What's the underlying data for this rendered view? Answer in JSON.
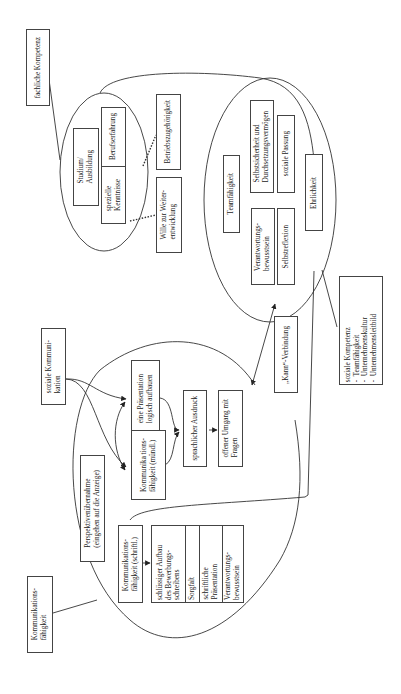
{
  "diagram": {
    "orientation": "rotated 90° counter-clockwise",
    "fachliche": {
      "title": "fachliche Kompetenz",
      "ellipse_items": {
        "studium": "Studium/\nAusbildung",
        "berufserfahrung": "Berufserfahrung",
        "spezielle_kenntnisse": "spezielle\nKenntnisse"
      },
      "outside_items": {
        "betriebszugehoerigkeit": "Betriebszugehörigkeit",
        "wille": "Wille zur Weiter-\nentwicklung"
      }
    },
    "soziale": {
      "ellipse_items": {
        "teamfaehigkeit": "Teamfähigkeit",
        "selbstsicherheit": "Selbstsicherheit und\nDurchsetzungsvermögen",
        "soziale_passung": "soziale Passung",
        "ehrlichkeit": "Ehrlichkeit",
        "verantwortung": "Verantwortungs-\nbewusstsein",
        "selbstreflexion": "Selbstreflexion"
      },
      "legend": {
        "title": "soziale Kompetenz",
        "items": [
          "Teamfähigkeit",
          "Unternehmenskultur",
          "Unternehmensleitbild"
        ],
        "bullet": "-"
      }
    },
    "kann_verbindung": "„Kann“-Verbindung",
    "kommunikation": {
      "title": "Kommunikations-\nfähigkeit",
      "soziale_kommunikation": "soziale Kommuni-\nkation",
      "perspektive": "Perspektivenübernahme\n(eingehen auf die Anzeige)",
      "muendlich": "Kommunika tions-\nfähigkeit (mündl.)",
      "praesentation": "eine Präsentation\nlogisch aufbauen",
      "sprachlicher_ausdruck": "sprachlicher Ausdruck",
      "offener_umgang": "offener Umgang mit\nFragen",
      "schriftlich": "Kommunikations-\nfähigkeit (schriftl.)",
      "schriftlich_items": [
        "schlüssiger Aufbau\ndes Bewerbungs-\nschreibens",
        "Sorgfalt",
        "schriftliche\nPräsentation",
        "Verantwortungs-\nbewusstsein"
      ]
    }
  },
  "colors": {
    "line": "#333333",
    "box_border": "#444444",
    "background": "#ffffff"
  }
}
